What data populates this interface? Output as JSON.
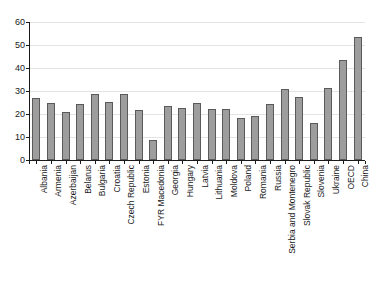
{
  "chart_data": {
    "type": "bar",
    "title": "",
    "subtitle": "",
    "xlabel": "",
    "ylabel": "",
    "ylim": [
      0,
      60
    ],
    "yticks": [
      0,
      10,
      20,
      30,
      40,
      50,
      60
    ],
    "ytick_labels": [
      "0",
      "10",
      "20",
      "30",
      "40",
      "50",
      "60"
    ],
    "grid": true,
    "legend": false,
    "legend_position": "none",
    "bar_color": "#9d9d9d",
    "bar_edge_color": "#5a5a5a",
    "axis_color": "#1a1a1a",
    "gridline_color": "#e4e4e4",
    "background_color": "#ffffff",
    "categories": [
      "Albania",
      "Armenia",
      "Azerbaijan",
      "Belarus",
      "Bulgaria",
      "Croatia",
      "Czech Republic",
      "Estonia",
      "FYR Macedonia",
      "Georgia",
      "Hungary",
      "Latvia",
      "Lithuania",
      "Moldova",
      "Poland",
      "Romania",
      "Russia",
      "Serbia and Montenegro",
      "Slovak Republic",
      "Slovenia",
      "Ukraine",
      "OECD",
      "China"
    ],
    "values": [
      27.0,
      24.7,
      21.0,
      24.3,
      28.8,
      25.2,
      28.9,
      21.6,
      8.9,
      23.6,
      22.6,
      24.9,
      22.2,
      22.3,
      18.3,
      19.2,
      24.2,
      30.8,
      27.4,
      16.2,
      31.3,
      43.5,
      53.7
    ]
  }
}
